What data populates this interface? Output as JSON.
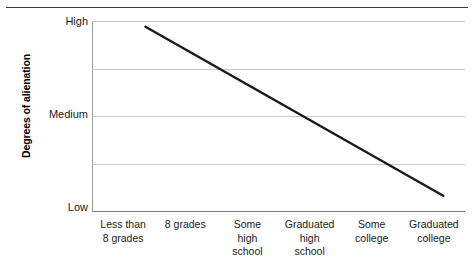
{
  "chart_data": {
    "type": "line",
    "title": "",
    "xlabel": "",
    "ylabel": "Degrees of alienation",
    "categories": [
      "Less than\n8 grades",
      "8 grades",
      "Some\nhigh\nschool",
      "Graduated\nhigh\nschool",
      "Some\ncollege",
      "Graduated\ncollege"
    ],
    "ytick_labels": [
      "High",
      "Medium",
      "Low"
    ],
    "ylim": [
      "Low",
      "High"
    ],
    "grid": true,
    "gridlines": 5,
    "legend": "none",
    "series": [
      {
        "name": "Degrees of alienation",
        "values": [
          "High",
          "",
          "",
          "",
          "",
          "Low"
        ],
        "color": "#1a1a1a",
        "note": "single straight declining line from high alienation at lowest education to low alienation at highest education"
      }
    ],
    "points": [
      {
        "x": 0.36,
        "y": 0.97
      },
      {
        "x": 5.15,
        "y": 0.08
      }
    ]
  },
  "axes": {
    "y_title": "Degrees of alienation",
    "y_ticks": [
      {
        "label": "High",
        "value": 1.0
      },
      {
        "label": "Medium",
        "value": 0.5
      },
      {
        "label": "Low",
        "value": 0.0
      }
    ],
    "x_categories": [
      {
        "lines": [
          "Less than",
          "8 grades"
        ]
      },
      {
        "lines": [
          "8 grades"
        ]
      },
      {
        "lines": [
          "Some",
          "high",
          "school"
        ]
      },
      {
        "lines": [
          "Graduated",
          "high",
          "school"
        ]
      },
      {
        "lines": [
          "Some",
          "college"
        ]
      },
      {
        "lines": [
          "Graduated",
          "college"
        ]
      }
    ]
  },
  "colors": {
    "line": "#1a1a1a",
    "grid": "#c9c9c9",
    "axis": "#777777",
    "frame": "#9a9a9a",
    "rule": "#3a3a3a",
    "text": "#1a1a1a",
    "background": "#ffffff"
  }
}
